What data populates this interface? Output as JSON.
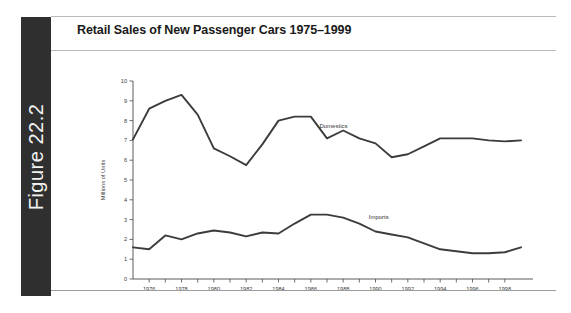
{
  "figure": {
    "tab_label": "Figure 22.2"
  },
  "chart_title": "Retail Sales of New Passenger Cars 1975–1999",
  "colors": {
    "tab_background": "#2f2f2f",
    "tab_text": "#f2f2f2",
    "title_text": "#1a1a1a",
    "rule": "#b9b9b9",
    "line": "#3c3c3c",
    "axis": "#4a4a4a"
  },
  "chart_data": {
    "type": "line",
    "title": "Retail Sales of New Passenger Cars 1975–1999",
    "xlabel": "",
    "ylabel": "Millions of Units",
    "xlim": [
      1975,
      1999
    ],
    "ylim": [
      0,
      10
    ],
    "grid": false,
    "legend": "inline-labels",
    "y_ticks": [
      0,
      1,
      2,
      3,
      4,
      5,
      6,
      7,
      8,
      9,
      10
    ],
    "y_tick_labels": [
      "0",
      "1",
      "2",
      "3",
      "4",
      "5",
      "6",
      "7",
      "8",
      "9",
      "10"
    ],
    "x_ticks": [
      1976,
      1977,
      1978,
      1979,
      1980,
      1981,
      1982,
      1983,
      1984,
      1985,
      1986,
      1987,
      1988,
      1989,
      1990,
      1991,
      1992,
      1993,
      1994,
      1995,
      1996,
      1997,
      1998
    ],
    "x_tick_labels_shown": [
      "1976",
      "1978",
      "1980",
      "1982",
      "1984",
      "1986",
      "1988",
      "1990",
      "1992",
      "1994",
      "1996",
      "1998"
    ],
    "x": [
      1975,
      1976,
      1977,
      1978,
      1979,
      1980,
      1981,
      1982,
      1983,
      1984,
      1985,
      1986,
      1987,
      1988,
      1989,
      1990,
      1991,
      1992,
      1993,
      1994,
      1995,
      1996,
      1997,
      1998,
      1999
    ],
    "series": [
      {
        "name": "Domestics",
        "label_x": 1987.4,
        "label_y": 7.62,
        "values": [
          7.05,
          8.6,
          9.0,
          9.3,
          8.3,
          6.6,
          6.2,
          5.75,
          6.8,
          8.0,
          8.2,
          8.2,
          7.1,
          7.5,
          7.1,
          6.85,
          6.15,
          6.3,
          6.7,
          7.1,
          7.1,
          7.1,
          7.0,
          6.95,
          7.0
        ]
      },
      {
        "name": "Imports",
        "label_x": 1990.2,
        "label_y": 3.05,
        "values": [
          1.6,
          1.5,
          2.2,
          2.0,
          2.3,
          2.45,
          2.35,
          2.15,
          2.35,
          2.3,
          2.8,
          3.25,
          3.25,
          3.1,
          2.8,
          2.4,
          2.25,
          2.1,
          1.8,
          1.5,
          1.4,
          1.3,
          1.3,
          1.35,
          1.6
        ]
      }
    ]
  }
}
